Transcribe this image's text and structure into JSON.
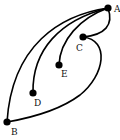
{
  "diagram": {
    "type": "graph",
    "nodes": [
      {
        "id": "A",
        "label": "A",
        "x": 108,
        "y": 8,
        "lx": 114,
        "ly": 12
      },
      {
        "id": "B",
        "label": "B",
        "x": 7,
        "y": 122,
        "lx": 11,
        "ly": 135
      },
      {
        "id": "C",
        "label": "C",
        "x": 83,
        "y": 37,
        "lx": 76,
        "ly": 51
      },
      {
        "id": "D",
        "label": "D",
        "x": 33,
        "y": 93,
        "lx": 34,
        "ly": 106
      },
      {
        "id": "E",
        "label": "E",
        "x": 59,
        "y": 65,
        "lx": 61,
        "ly": 77
      }
    ],
    "edges": [
      {
        "from": "A",
        "to": "B",
        "path": "M108,8 C60,15 12,45 7,122"
      },
      {
        "from": "A",
        "to": "D",
        "path": "M108,8 C60,20 32,50 33,93"
      },
      {
        "from": "A",
        "to": "E",
        "path": "M108,8 C80,18 60,40 59,65"
      },
      {
        "from": "A",
        "to": "C",
        "path": "M108,8 C114,25 105,35 83,37"
      },
      {
        "from": "C",
        "to": "B",
        "path": "M83,37 C110,40 105,75 80,95 C60,110 30,118 7,122"
      }
    ],
    "color": "#000000"
  }
}
